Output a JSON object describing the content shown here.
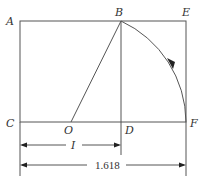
{
  "diagram": {
    "type": "golden-rectangle-construction",
    "points": {
      "A": {
        "label": "A"
      },
      "B": {
        "label": "B"
      },
      "E": {
        "label": "E"
      },
      "C": {
        "label": "C"
      },
      "O": {
        "label": "O"
      },
      "D": {
        "label": "D"
      },
      "F": {
        "label": "F"
      }
    },
    "dimensions": {
      "unit_label": "I",
      "total_label": "1.618"
    },
    "colors": {
      "line": "#555555",
      "text": "#333333"
    }
  }
}
